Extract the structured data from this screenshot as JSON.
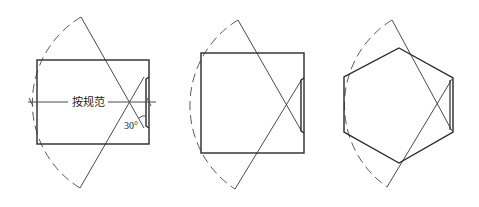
{
  "diagram": {
    "title": "",
    "figures": [
      {
        "id": "rectangle-with-dimension",
        "room_shape": "rectangle",
        "dimension_label": "按规范",
        "angle_label": "30°"
      },
      {
        "id": "square-room",
        "room_shape": "square"
      },
      {
        "id": "hexagon-room",
        "room_shape": "hexagon"
      }
    ],
    "colors": {
      "line": "#2a2a2a",
      "dashed_arc": "#5a5a5a",
      "background": "#ffffff"
    }
  }
}
